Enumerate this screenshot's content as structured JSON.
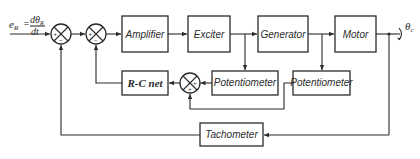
{
  "diagram": {
    "type": "block-diagram",
    "input": {
      "lhs": "e",
      "lhs_sub": "R",
      "num": "dθ",
      "num_sub": "R",
      "den": "dt"
    },
    "output": {
      "symbol": "θ",
      "sub": "c"
    },
    "blocks": {
      "amplifier": "Amplifier",
      "exciter": "Exciter",
      "generator": "Generator",
      "motor": "Motor",
      "rc_net": "R-C net",
      "potentiometer_1": "Potentiometer",
      "potentiometer_2": "Potentiometer",
      "tachometer": "Tachometer"
    },
    "summing_junctions": [
      {
        "id": "sum-1",
        "signs": {
          "left": "+",
          "bottom": "−"
        }
      },
      {
        "id": "sum-2",
        "signs": {
          "left": "+",
          "bottom": "−"
        }
      },
      {
        "id": "sum-3",
        "signs": {
          "right": "+",
          "bottom": "+"
        }
      }
    ],
    "signs": {
      "plus": "+",
      "minus": "−"
    },
    "connections": [
      "input → sum-1",
      "sum-1 → sum-2",
      "sum-2 → Amplifier",
      "Amplifier → Exciter",
      "Exciter → Generator",
      "Generator → Motor",
      "Motor → output θc",
      "Exciter output → Potentiometer (1)",
      "Generator output → Potentiometer (2)",
      "Potentiometer (1) → sum-3 (+)",
      "Potentiometer (2) → sum-3 (+)",
      "sum-3 → R-C net",
      "R-C net → sum-2 (−)",
      "output θc → Tachometer",
      "Tachometer → sum-1 (−)"
    ]
  }
}
